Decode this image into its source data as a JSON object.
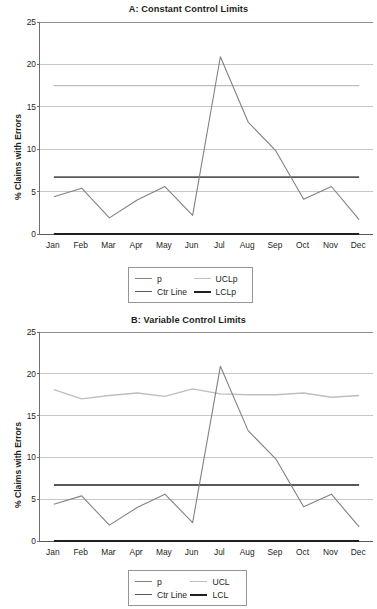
{
  "figure": {
    "panels": [
      "A",
      "B"
    ]
  },
  "chart_data": [
    {
      "type": "line",
      "id": "panel-a",
      "title": "A: Constant Control Limits",
      "xlabel": "",
      "ylabel": "% Claims with Errors",
      "categories": [
        "Jan",
        "Feb",
        "Mar",
        "Apr",
        "May",
        "Jun",
        "Jul",
        "Aug",
        "Sep",
        "Oct",
        "Nov",
        "Dec"
      ],
      "ylim": [
        0,
        25
      ],
      "yticks": [
        0,
        5,
        10,
        15,
        20,
        25
      ],
      "grid": true,
      "legend_position": "bottom",
      "series": [
        {
          "name": "p",
          "color": "#808285",
          "width": 1.1,
          "values": [
            4.4,
            5.4,
            1.9,
            4.0,
            5.6,
            2.2,
            20.9,
            13.2,
            9.8,
            4.1,
            5.6,
            1.7
          ]
        },
        {
          "name": "UCLp",
          "color": "#bcbec0",
          "width": 1.4,
          "values": [
            17.5,
            17.5,
            17.5,
            17.5,
            17.5,
            17.5,
            17.5,
            17.5,
            17.5,
            17.5,
            17.5,
            17.5
          ]
        },
        {
          "name": "Ctr Line",
          "color": "#58595b",
          "width": 1.8,
          "values": [
            6.7,
            6.7,
            6.7,
            6.7,
            6.7,
            6.7,
            6.7,
            6.7,
            6.7,
            6.7,
            6.7,
            6.7
          ]
        },
        {
          "name": "LCLp",
          "color": "#231f20",
          "width": 2.0,
          "values": [
            0.0,
            0.0,
            0.0,
            0.0,
            0.0,
            0.0,
            0.0,
            0.0,
            0.0,
            0.0,
            0.0,
            0.0
          ]
        }
      ],
      "legend": [
        {
          "label": "p",
          "color": "#808285",
          "width": 1.1
        },
        {
          "label": "UCLp",
          "color": "#bcbec0",
          "width": 1.4
        },
        {
          "label": "Ctr Line",
          "color": "#58595b",
          "width": 1.8
        },
        {
          "label": "LCLp",
          "color": "#231f20",
          "width": 2.4
        }
      ]
    },
    {
      "type": "line",
      "id": "panel-b",
      "title": "B: Variable Control Limits",
      "xlabel": "",
      "ylabel": "% Claims with Errors",
      "categories": [
        "Jan",
        "Feb",
        "Mar",
        "Apr",
        "May",
        "Jun",
        "Jul",
        "Aug",
        "Sep",
        "Oct",
        "Nov",
        "Dec"
      ],
      "ylim": [
        0,
        25
      ],
      "yticks": [
        0,
        5,
        10,
        15,
        20,
        25
      ],
      "grid": true,
      "legend_position": "bottom",
      "series": [
        {
          "name": "p",
          "color": "#808285",
          "width": 1.1,
          "values": [
            4.4,
            5.4,
            1.9,
            4.0,
            5.6,
            2.2,
            20.9,
            13.2,
            9.8,
            4.1,
            5.6,
            1.7
          ]
        },
        {
          "name": "UCL",
          "color": "#bcbec0",
          "width": 1.4,
          "values": [
            18.1,
            17.0,
            17.4,
            17.7,
            17.3,
            18.2,
            17.6,
            17.5,
            17.5,
            17.7,
            17.2,
            17.4
          ]
        },
        {
          "name": "Ctr Line",
          "color": "#58595b",
          "width": 1.8,
          "values": [
            6.7,
            6.7,
            6.7,
            6.7,
            6.7,
            6.7,
            6.7,
            6.7,
            6.7,
            6.7,
            6.7,
            6.7
          ]
        },
        {
          "name": "LCL",
          "color": "#231f20",
          "width": 2.0,
          "values": [
            0.0,
            0.0,
            0.0,
            0.0,
            0.0,
            0.0,
            0.0,
            0.0,
            0.0,
            0.0,
            0.0,
            0.0
          ]
        }
      ],
      "legend": [
        {
          "label": "p",
          "color": "#808285",
          "width": 1.1
        },
        {
          "label": "UCL",
          "color": "#bcbec0",
          "width": 1.4
        },
        {
          "label": "Ctr Line",
          "color": "#58595b",
          "width": 1.8
        },
        {
          "label": "LCL",
          "color": "#231f20",
          "width": 2.4
        }
      ]
    }
  ]
}
